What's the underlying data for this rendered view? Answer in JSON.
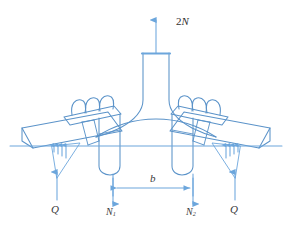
{
  "figure": {
    "stroke_color": "#6CA6DC",
    "stroke_color_dark": "#5B93C9",
    "text_color": "#3a3a3a",
    "background": "#ffffff"
  },
  "labels": {
    "top_force": {
      "text": "2N",
      "prefix": "2",
      "symbol": "N"
    },
    "left_reaction": {
      "text": "Q"
    },
    "right_reaction": {
      "text": "Q"
    },
    "inner_left": {
      "symbol": "N",
      "subscript": "1"
    },
    "inner_right": {
      "symbol": "N",
      "subscript": "2"
    },
    "dimension": {
      "text": "b"
    }
  },
  "forces": [
    {
      "name": "top_force",
      "label": "2N",
      "direction": "up",
      "x": 160,
      "y": 22
    },
    {
      "name": "left_reaction",
      "label": "Q",
      "direction": "up",
      "x": 58,
      "y": 212
    },
    {
      "name": "right_reaction",
      "label": "Q",
      "direction": "up",
      "x": 248,
      "y": 212
    },
    {
      "name": "inner_left",
      "label": "N1",
      "direction": "down",
      "x": 113,
      "y": 214
    },
    {
      "name": "inner_right",
      "label": "N2",
      "direction": "down",
      "x": 193,
      "y": 214
    }
  ],
  "dimensions": [
    {
      "name": "b",
      "label": "b",
      "from_x": 113,
      "to_x": 193,
      "y": 188
    }
  ]
}
